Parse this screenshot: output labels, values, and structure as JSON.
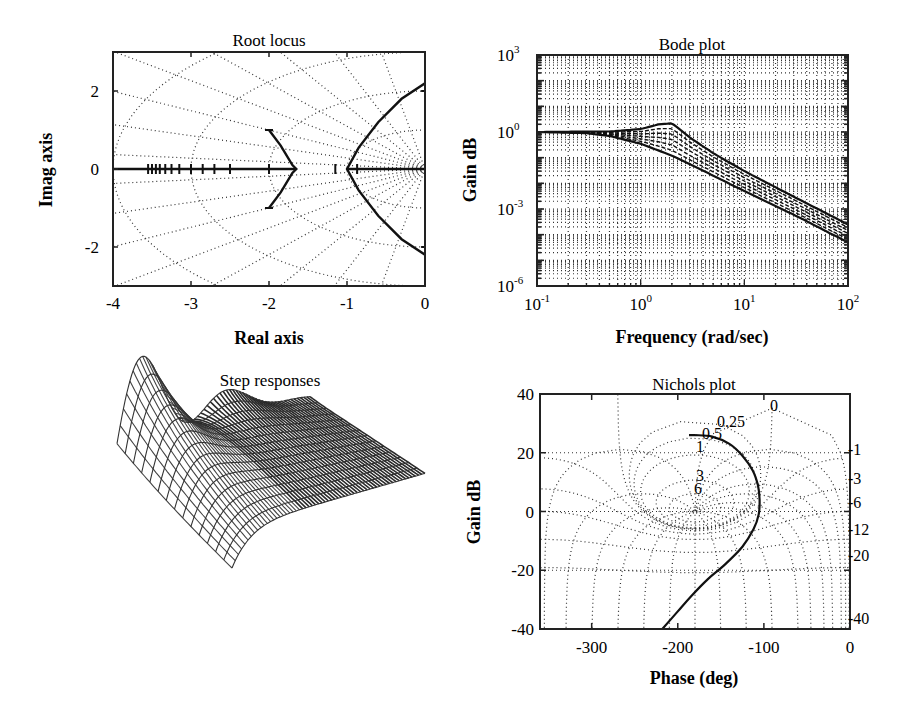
{
  "chart_data": [
    {
      "type": "line",
      "title": "Root locus",
      "xlabel": "Real axis",
      "ylabel": "Imag axis",
      "xlim": [
        -4,
        0
      ],
      "ylim": [
        -3,
        3
      ],
      "xticks": [
        "-4",
        "-3",
        "-2",
        "-1",
        "0"
      ],
      "yticks": [
        "2",
        "0",
        "-2"
      ],
      "grid": "s-plane damping/natural-frequency grid (dotted)",
      "series": [
        {
          "name": "real-axis branch",
          "points": [
            [
              -4,
              0
            ],
            [
              -1.65,
              0
            ]
          ]
        },
        {
          "name": "inner branch",
          "points": [
            [
              -2,
              1
            ],
            [
              -1.85,
              0.6
            ],
            [
              -1.7,
              0.1
            ],
            [
              -1.65,
              0
            ],
            [
              -1.7,
              -0.1
            ],
            [
              -1.85,
              -0.6
            ],
            [
              -2,
              -1
            ]
          ]
        },
        {
          "name": "outer branch",
          "points": [
            [
              0,
              2.2
            ],
            [
              -0.3,
              1.8
            ],
            [
              -0.6,
              1.2
            ],
            [
              -0.85,
              0.55
            ],
            [
              -1,
              0
            ],
            [
              -0.85,
              -0.55
            ],
            [
              -0.6,
              -1.2
            ],
            [
              -0.3,
              -1.8
            ],
            [
              0,
              -2.2
            ]
          ]
        },
        {
          "name": "real-axis right segment",
          "points": [
            [
              -1,
              0
            ],
            [
              0,
              0
            ]
          ]
        }
      ],
      "markers_real_axis": [
        -3.55,
        -3.5,
        -3.45,
        -3.4,
        -3.33,
        -3.25,
        -3.15,
        -3,
        -2.85,
        -2.7,
        -2.5,
        -2,
        -1.15,
        -0.87
      ]
    },
    {
      "type": "line",
      "title": "Bode plot",
      "xlabel": "Frequency (rad/sec)",
      "ylabel": "Gain dB",
      "xscale": "log",
      "yscale": "log",
      "xlim": [
        0.1,
        100
      ],
      "ylim": [
        1e-06,
        1000
      ],
      "xticks": [
        {
          "base": "10",
          "exp": "-1"
        },
        {
          "base": "10",
          "exp": "0"
        },
        {
          "base": "10",
          "exp": "1"
        },
        {
          "base": "10",
          "exp": "2"
        }
      ],
      "yticks": [
        {
          "base": "10",
          "exp": "3"
        },
        {
          "base": "10",
          "exp": "0"
        },
        {
          "base": "10",
          "exp": "-3"
        },
        {
          "base": "10",
          "exp": "-6"
        }
      ],
      "grid": true,
      "series": [
        {
          "name": "upper envelope (peak)",
          "x": [
            0.1,
            0.5,
            1,
            1.5,
            2,
            3,
            5,
            10,
            30,
            100
          ],
          "y": [
            1,
            1.05,
            1.3,
            2.0,
            2.2,
            0.6,
            0.15,
            0.03,
            0.003,
            0.00025
          ]
        },
        {
          "name": "lower envelope",
          "x": [
            0.1,
            0.3,
            0.5,
            1,
            2,
            5,
            10,
            30,
            100
          ],
          "y": [
            1,
            0.9,
            0.7,
            0.35,
            0.12,
            0.02,
            0.005,
            0.0006,
            5e-05
          ]
        }
      ]
    },
    {
      "type": "surface",
      "title": "Step responses",
      "description": "3D wireframe surface of a family of step responses; oscillatory ridges on the left decaying to a smooth settled surface on the right",
      "xlabel": "",
      "ylabel": "",
      "zlabel": ""
    },
    {
      "type": "line",
      "title": "Nichols plot",
      "xlabel": "Phase (deg)",
      "ylabel": "Gain dB",
      "xlim": [
        -360,
        0
      ],
      "ylim": [
        -40,
        40
      ],
      "xticks": [
        "-300",
        "-200",
        "-100",
        "0"
      ],
      "yticks": [
        "40",
        "20",
        "0",
        "-20",
        "-40"
      ],
      "grid": "Nichols chart grid (dotted)",
      "closed_loop_gain_labels": [
        "0",
        "0.25",
        "0.5",
        "1",
        "3",
        "6"
      ],
      "closed_loop_gain_labels_right": [
        "-1",
        "-3",
        "-6",
        "-12",
        "-20",
        "-40"
      ],
      "series": [
        {
          "name": "open-loop response",
          "phase": [
            -180,
            -160,
            -140,
            -125,
            -113,
            -107,
            -105,
            -106,
            -112,
            -125,
            -145,
            -165,
            -185,
            -200,
            -218
          ],
          "gain": [
            26,
            25.5,
            23,
            19,
            14,
            9,
            4,
            -1,
            -6,
            -12,
            -18,
            -23,
            -29,
            -34,
            -40
          ]
        }
      ]
    }
  ],
  "plots": {
    "root_locus": {
      "title": "Root locus",
      "xlabel": "Real axis",
      "ylabel": "Imag axis",
      "xticks": [
        "-4",
        "-3",
        "-2",
        "-1",
        "0"
      ],
      "yticks": [
        "2",
        "0",
        "-2"
      ]
    },
    "bode": {
      "title": "Bode plot",
      "xlabel": "Frequency (rad/sec)",
      "ylabel": "Gain dB"
    },
    "step": {
      "title": "Step responses"
    },
    "nichols": {
      "title": "Nichols plot",
      "xlabel": "Phase (deg)",
      "ylabel": "Gain dB",
      "xticks": [
        "-300",
        "-200",
        "-100",
        "0"
      ],
      "yticks": [
        "40",
        "20",
        "0",
        "-20",
        "-40"
      ],
      "inner_labels": [
        "0",
        "0.25",
        "0.5",
        "1",
        "3",
        "6"
      ],
      "right_labels": [
        "-1",
        "-3",
        "-6",
        "-12",
        "-20",
        "-40"
      ]
    }
  }
}
